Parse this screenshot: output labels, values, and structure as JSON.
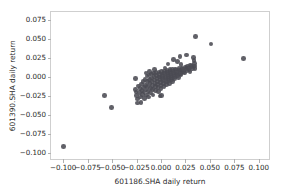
{
  "chart_data": {
    "type": "scatter",
    "title": "",
    "xlabel": "601186.SHA daily return",
    "ylabel": "601390.SHA daily return",
    "xlim": [
      -0.1125,
      0.1125
    ],
    "ylim": [
      -0.1105,
      0.0855
    ],
    "xticks": [
      -0.1,
      -0.075,
      -0.05,
      -0.025,
      0.0,
      0.025,
      0.05,
      0.075,
      0.1
    ],
    "xticklabels": [
      "−0.100",
      "−0.075",
      "−0.050",
      "−0.025",
      "0.000",
      "0.025",
      "0.050",
      "0.075",
      "0.100"
    ],
    "yticks": [
      0.075,
      0.05,
      0.025,
      0.0,
      -0.025,
      -0.05,
      -0.075,
      -0.1
    ],
    "yticklabels": [
      "0.075",
      "0.050",
      "0.025",
      "0.000",
      "−0.025",
      "−0.050",
      "−0.075",
      "−0.100"
    ],
    "grid": false,
    "legend": null,
    "marker": {
      "color": "#4b4b53",
      "size": 4.6,
      "shape": "circle",
      "alpha": 0.88
    },
    "series": [
      {
        "name": "daily returns",
        "points": [
          [
            -0.1,
            -0.0912
          ],
          [
            -0.0575,
            -0.0243
          ],
          [
            -0.0505,
            -0.0405
          ],
          [
            -0.0258,
            -0.002
          ],
          [
            -0.0262,
            -0.0162
          ],
          [
            -0.0255,
            -0.0196
          ],
          [
            -0.0248,
            -0.0245
          ],
          [
            -0.0243,
            -0.029
          ],
          [
            -0.0238,
            -0.034
          ],
          [
            -0.0228,
            -0.0118
          ],
          [
            -0.0222,
            -0.0205
          ],
          [
            -0.0215,
            -0.0152
          ],
          [
            -0.0208,
            -0.0262
          ],
          [
            -0.02,
            -0.0092
          ],
          [
            -0.0196,
            -0.0178
          ],
          [
            -0.019,
            -0.0228
          ],
          [
            -0.0185,
            -0.0058
          ],
          [
            -0.018,
            -0.014
          ],
          [
            -0.0175,
            -0.0198
          ],
          [
            -0.017,
            -0.0282
          ],
          [
            -0.0165,
            -0.0035
          ],
          [
            -0.016,
            -0.0108
          ],
          [
            -0.0155,
            -0.017
          ],
          [
            -0.015,
            -0.0238
          ],
          [
            -0.0145,
            0.0012
          ],
          [
            -0.014,
            -0.0062
          ],
          [
            -0.0136,
            -0.0125
          ],
          [
            -0.0132,
            -0.0192
          ],
          [
            -0.0128,
            -0.0265
          ],
          [
            -0.0122,
            0.0028
          ],
          [
            -0.0118,
            -0.003
          ],
          [
            -0.0114,
            -0.0088
          ],
          [
            -0.011,
            -0.0148
          ],
          [
            -0.0106,
            -0.0212
          ],
          [
            -0.01,
            0.0042
          ],
          [
            -0.0096,
            -0.0012
          ],
          [
            -0.0092,
            -0.006
          ],
          [
            -0.0088,
            -0.0112
          ],
          [
            -0.0084,
            -0.0165
          ],
          [
            -0.008,
            -0.0235
          ],
          [
            -0.0075,
            0.0052
          ],
          [
            -0.0071,
            0.0005
          ],
          [
            -0.0067,
            -0.0038
          ],
          [
            -0.0063,
            -0.0082
          ],
          [
            -0.0059,
            -0.0128
          ],
          [
            -0.0055,
            -0.0178
          ],
          [
            -0.005,
            0.006
          ],
          [
            -0.0046,
            0.0022
          ],
          [
            -0.0042,
            -0.0018
          ],
          [
            -0.0038,
            -0.0058
          ],
          [
            -0.0034,
            -0.0098
          ],
          [
            -0.003,
            -0.014
          ],
          [
            -0.0026,
            -0.0192
          ],
          [
            -0.0022,
            0.0068
          ],
          [
            -0.0018,
            0.0034
          ],
          [
            -0.0014,
            0.0
          ],
          [
            -0.001,
            -0.0035
          ],
          [
            -0.0006,
            -0.0072
          ],
          [
            -0.0002,
            -0.011
          ],
          [
            0.0002,
            -0.0155
          ],
          [
            0.0004,
            -0.0245
          ],
          [
            0.0006,
            0.0072
          ],
          [
            0.001,
            0.0042
          ],
          [
            0.0014,
            0.001
          ],
          [
            0.0018,
            -0.002
          ],
          [
            0.0022,
            -0.0052
          ],
          [
            0.0026,
            -0.0088
          ],
          [
            0.003,
            -0.0128
          ],
          [
            0.0034,
            0.008
          ],
          [
            0.0038,
            0.0052
          ],
          [
            0.0042,
            0.0024
          ],
          [
            0.0046,
            -0.0005
          ],
          [
            0.005,
            -0.0035
          ],
          [
            0.0054,
            -0.0068
          ],
          [
            0.0058,
            -0.0102
          ],
          [
            0.0062,
            0.0088
          ],
          [
            0.0066,
            0.0062
          ],
          [
            0.007,
            0.0036
          ],
          [
            0.0074,
            0.001
          ],
          [
            0.0078,
            -0.0018
          ],
          [
            0.0082,
            -0.0048
          ],
          [
            0.0086,
            -0.0082
          ],
          [
            0.009,
            0.0095
          ],
          [
            0.0094,
            0.007
          ],
          [
            0.0098,
            0.0046
          ],
          [
            0.0102,
            0.0022
          ],
          [
            0.0106,
            -0.0004
          ],
          [
            0.011,
            -0.0032
          ],
          [
            0.0115,
            -0.0062
          ],
          [
            0.012,
            0.01
          ],
          [
            0.0124,
            0.0078
          ],
          [
            0.0128,
            0.0055
          ],
          [
            0.0132,
            0.0032
          ],
          [
            0.0136,
            0.0008
          ],
          [
            0.014,
            -0.0018
          ],
          [
            0.0146,
            0.0105
          ],
          [
            0.0152,
            0.0085
          ],
          [
            0.0158,
            0.0062
          ],
          [
            0.0164,
            0.004
          ],
          [
            0.017,
            0.0018
          ],
          [
            0.0176,
            -0.0006
          ],
          [
            0.0182,
            0.0112
          ],
          [
            0.0188,
            0.0092
          ],
          [
            0.0194,
            0.007
          ],
          [
            0.02,
            0.0048
          ],
          [
            0.0206,
            0.0026
          ],
          [
            0.0196,
            0.0272
          ],
          [
            0.0214,
            0.012
          ],
          [
            0.0222,
            0.0098
          ],
          [
            0.023,
            0.0076
          ],
          [
            0.0238,
            0.0054
          ],
          [
            0.0248,
            0.013
          ],
          [
            0.0256,
            0.0108
          ],
          [
            0.0264,
            0.0086
          ],
          [
            0.0258,
            0.0292
          ],
          [
            0.0272,
            0.0138
          ],
          [
            0.028,
            0.0116
          ],
          [
            0.0288,
            0.0094
          ],
          [
            0.0296,
            0.0072
          ],
          [
            0.0304,
            0.016
          ],
          [
            0.0312,
            0.0136
          ],
          [
            0.032,
            0.0112
          ],
          [
            0.033,
            0.0255
          ],
          [
            0.0336,
            0.0215
          ],
          [
            0.034,
            0.018
          ],
          [
            0.0344,
            0.0145
          ],
          [
            0.0348,
            0.0108
          ],
          [
            0.0352,
            0.0532
          ],
          [
            0.051,
            0.0435
          ],
          [
            0.0845,
            0.024
          ],
          [
            -0.0012,
            -0.0248
          ],
          [
            0.0125,
            0.023
          ],
          [
            -0.0205,
            -0.0332
          ],
          [
            0.0072,
            0.017
          ],
          [
            0.0042,
            0.0118
          ],
          [
            -0.0068,
            0.0095
          ],
          [
            -0.0118,
            0.0075
          ],
          [
            0.0168,
            0.0205
          ],
          [
            0.0205,
            0.0168
          ],
          [
            -0.0155,
            0.0055
          ]
        ]
      }
    ]
  }
}
